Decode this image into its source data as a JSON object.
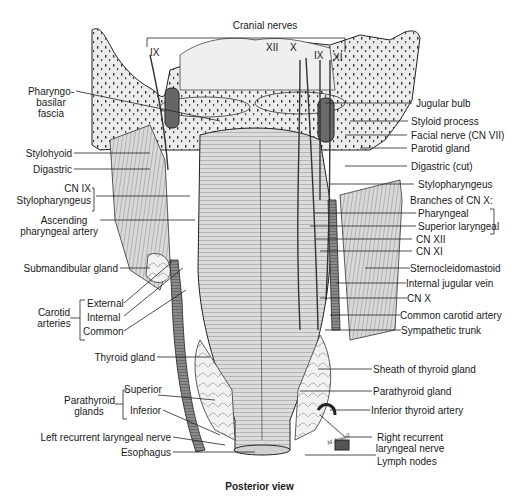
{
  "figure": {
    "caption": "Posterior view",
    "view": "Posterior view of pharynx and related structures",
    "signature": "M. Sewell"
  },
  "top_labels": {
    "group_title": "Cranial nerves",
    "left_nerve": "IX",
    "right_nerves": [
      "XII",
      "X",
      "IX",
      "XI"
    ]
  },
  "left_labels": {
    "pharyngobasilar_line1": "Pharyngo-",
    "pharyngobasilar_line2": "basilar",
    "pharyngobasilar_line3": "fascia",
    "stylohyoid": "Stylohyoid",
    "digastric": "Digastric",
    "cn_ix": "CN IX",
    "stylopharyngeus": "Stylopharyngeus",
    "ascending_line1": "Ascending",
    "ascending_line2": "pharyngeal artery",
    "submandibular": "Submandibular gland",
    "carotid_group_line1": "Carotid",
    "carotid_group_line2": "arteries",
    "carotid_external": "External",
    "carotid_internal": "Internal",
    "carotid_common": "Common",
    "thyroid_gland": "Thyroid gland",
    "parathyroid_group_line1": "Parathyroid",
    "parathyroid_group_line2": "glands",
    "parathyroid_superior": "Superior",
    "parathyroid_inferior": "Inferior",
    "left_recurrent": "Left recurrent laryngeal nerve",
    "esophagus": "Esophagus"
  },
  "right_labels": {
    "jugular_bulb": "Jugular bulb",
    "styloid_process": "Styloid process",
    "facial_nerve": "Facial nerve (CN VII)",
    "parotid_gland": "Parotid gland",
    "digastric_cut": "Digastric (cut)",
    "stylopharyngeus": "Stylopharyngeus",
    "branches_title": "Branches of CN X:",
    "pharyngeal": "Pharyngeal",
    "superior_laryngeal": "Superior laryngeal",
    "cn_xii": "CN XII",
    "cn_xi": "CN XI",
    "sternocleidomastoid": "Sternocleidomastoid",
    "internal_jugular": "Internal jugular vein",
    "cn_x": "CN X",
    "common_carotid": "Common carotid artery",
    "sympathetic_trunk": "Sympathetic trunk",
    "sheath_thyroid": "Sheath of thyroid gland",
    "parathyroid_gland": "Parathyroid gland",
    "inferior_thyroid": "Inferior thyroid artery",
    "right_recurrent_line1": "Right recurrent",
    "right_recurrent_line2": "laryngeal nerve",
    "lymph_nodes": "Lymph nodes"
  },
  "colors": {
    "ink": "#1a1a1a",
    "bone": "#ebebeb",
    "muscle": "#cfcfcf",
    "vessel_dark": "#555555",
    "background": "#ffffff"
  }
}
